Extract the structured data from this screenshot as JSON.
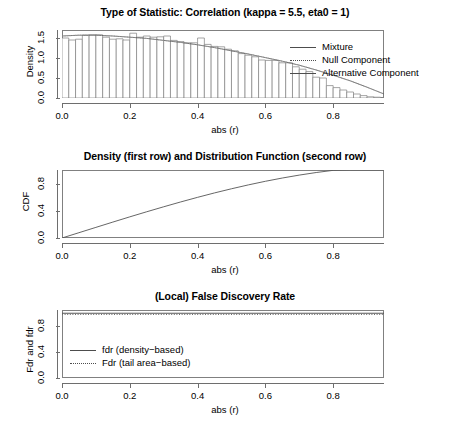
{
  "panels": [
    {
      "id": "density",
      "title": "Type of Statistic: Correlation (kappa = 5.5, eta0 = 1)",
      "xlabel": "abs (r)",
      "ylabel": "Density",
      "xticks": [
        "0.0",
        "0.2",
        "0.4",
        "0.6",
        "0.8"
      ],
      "yticks": [
        "0.0",
        "0.5",
        "1.0",
        "1.5"
      ],
      "legend": [
        {
          "label": "Mixture",
          "style": "solid"
        },
        {
          "label": "Null Component",
          "style": "dotted"
        },
        {
          "label": "Alternative Component",
          "style": "solid"
        }
      ]
    },
    {
      "id": "cdf",
      "title": "Density (first row) and Distribution Function (second row)",
      "xlabel": "abs (r)",
      "ylabel": "CDF",
      "xticks": [
        "0.0",
        "0.2",
        "0.4",
        "0.6",
        "0.8"
      ],
      "yticks": [
        "0.0",
        "0.4",
        "0.8"
      ]
    },
    {
      "id": "fdr",
      "title": "(Local) False Discovery Rate",
      "xlabel": "abs (r)",
      "ylabel": "Fdr and fdr",
      "xticks": [
        "0.0",
        "0.2",
        "0.4",
        "0.6",
        "0.8"
      ],
      "yticks": [
        "0.0",
        "0.4",
        "0.8"
      ],
      "legend": [
        {
          "label": "fdr (density−based)",
          "style": "solid"
        },
        {
          "label": "Fdr (tail area−based)",
          "style": "dotted"
        }
      ]
    }
  ],
  "colors": {
    "axis": "#6e6e6e",
    "frame": "#808080",
    "bar_stroke": "#808080",
    "bar_fill": "#ffffff",
    "curve": "#555555",
    "dotted": "#999999"
  },
  "chart_data": [
    {
      "type": "bar",
      "title": "Type of Statistic: Correlation (kappa = 5.5, eta0 = 1)",
      "xlabel": "abs (r)",
      "ylabel": "Density",
      "xlim": [
        0,
        0.95
      ],
      "ylim": [
        0,
        1.7
      ],
      "xticks": [
        0.0,
        0.2,
        0.4,
        0.6,
        0.8
      ],
      "yticks": [
        0.0,
        0.5,
        1.0,
        1.5
      ],
      "grid": false,
      "legend_position": "top-right",
      "bin_width": 0.02,
      "categories": [
        0.01,
        0.03,
        0.05,
        0.07,
        0.09,
        0.11,
        0.13,
        0.15,
        0.17,
        0.19,
        0.21,
        0.23,
        0.25,
        0.27,
        0.29,
        0.31,
        0.33,
        0.35,
        0.37,
        0.39,
        0.41,
        0.43,
        0.45,
        0.47,
        0.49,
        0.51,
        0.53,
        0.55,
        0.57,
        0.59,
        0.61,
        0.63,
        0.65,
        0.67,
        0.69,
        0.71,
        0.73,
        0.75,
        0.77,
        0.79,
        0.81,
        0.83,
        0.85,
        0.87,
        0.89,
        0.91,
        0.93
      ],
      "values": [
        1.5,
        1.45,
        1.47,
        1.57,
        1.58,
        1.58,
        1.52,
        1.47,
        1.48,
        1.45,
        1.62,
        1.52,
        1.55,
        1.52,
        1.53,
        1.55,
        1.44,
        1.41,
        1.38,
        1.38,
        1.5,
        1.34,
        1.29,
        1.28,
        1.22,
        1.18,
        1.11,
        1.07,
        1.03,
        0.95,
        0.94,
        0.94,
        0.88,
        0.88,
        0.78,
        0.72,
        0.66,
        0.52,
        0.5,
        0.31,
        0.26,
        0.2,
        0.15,
        0.1,
        0.06,
        0.03,
        0.02
      ],
      "series": [
        {
          "name": "Mixture",
          "style": "solid",
          "x": [
            0.0,
            0.05,
            0.1,
            0.15,
            0.2,
            0.25,
            0.3,
            0.35,
            0.4,
            0.45,
            0.5,
            0.55,
            0.6,
            0.65,
            0.7,
            0.75,
            0.8,
            0.85,
            0.9,
            0.95
          ],
          "values": [
            1.55,
            1.57,
            1.57,
            1.55,
            1.52,
            1.49,
            1.44,
            1.39,
            1.33,
            1.26,
            1.18,
            1.1,
            1.01,
            0.92,
            0.82,
            0.7,
            0.57,
            0.43,
            0.27,
            0.1
          ]
        },
        {
          "name": "Null Component",
          "style": "dotted",
          "x": [
            0.0,
            0.05,
            0.1,
            0.15,
            0.2,
            0.25,
            0.3,
            0.35,
            0.4,
            0.45,
            0.5,
            0.55,
            0.6,
            0.65,
            0.7,
            0.75,
            0.8,
            0.85,
            0.9,
            0.95
          ],
          "values": [
            1.55,
            1.57,
            1.57,
            1.55,
            1.52,
            1.49,
            1.44,
            1.39,
            1.33,
            1.26,
            1.18,
            1.1,
            1.01,
            0.92,
            0.82,
            0.7,
            0.57,
            0.43,
            0.27,
            0.1
          ]
        },
        {
          "name": "Alternative Component",
          "style": "solid",
          "x": [],
          "values": []
        }
      ]
    },
    {
      "type": "line",
      "title": "Density (first row) and Distribution Function (second row)",
      "xlabel": "abs (r)",
      "ylabel": "CDF",
      "xlim": [
        0,
        0.95
      ],
      "ylim": [
        0,
        1.0
      ],
      "xticks": [
        0.0,
        0.2,
        0.4,
        0.6,
        0.8
      ],
      "yticks": [
        0.0,
        0.4,
        0.8
      ],
      "grid": false,
      "series": [
        {
          "name": "CDF",
          "style": "solid",
          "x": [
            0.0,
            0.05,
            0.1,
            0.15,
            0.2,
            0.25,
            0.3,
            0.35,
            0.4,
            0.45,
            0.5,
            0.55,
            0.6,
            0.65,
            0.7,
            0.75,
            0.8,
            0.85,
            0.9,
            0.95
          ],
          "values": [
            0.0,
            0.078,
            0.156,
            0.234,
            0.311,
            0.386,
            0.459,
            0.53,
            0.598,
            0.663,
            0.724,
            0.781,
            0.834,
            0.882,
            0.925,
            0.963,
            0.995,
            1.0,
            1.0,
            1.0
          ]
        }
      ]
    },
    {
      "type": "line",
      "title": "(Local) False Discovery Rate",
      "xlabel": "abs (r)",
      "ylabel": "Fdr and fdr",
      "xlim": [
        0,
        0.95
      ],
      "ylim": [
        0,
        1.05
      ],
      "xticks": [
        0.0,
        0.2,
        0.4,
        0.6,
        0.8
      ],
      "yticks": [
        0.0,
        0.4,
        0.8
      ],
      "grid": false,
      "legend_position": "center-left",
      "series": [
        {
          "name": "fdr (density−based)",
          "style": "solid",
          "x": [
            0.0,
            0.95
          ],
          "values": [
            1.0,
            1.0
          ]
        },
        {
          "name": "Fdr (tail area−based)",
          "style": "dotted",
          "x": [
            0.0,
            0.95
          ],
          "values": [
            1.0,
            1.0
          ]
        }
      ]
    }
  ]
}
